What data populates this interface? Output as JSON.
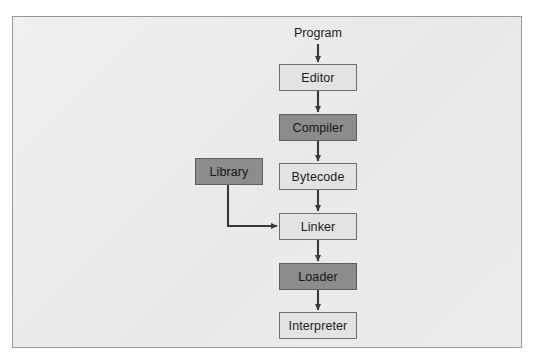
{
  "diagram": {
    "canvas": {
      "width": 535,
      "height": 360
    },
    "frame": {
      "x": 12,
      "y": 16,
      "width": 510,
      "height": 332,
      "fill": "#ececec",
      "border": "#9a9a9a"
    },
    "palette": {
      "light_box_fill": "#e3e3e3",
      "dark_box_fill": "#8c8c8c",
      "box_border": "#6f6f6f",
      "arrow_color": "#3a3a3a",
      "text_color": "#1c1c1c",
      "page_background": "#ffffff"
    },
    "captions": [
      {
        "id": "program",
        "label": "Program",
        "x": 318,
        "y": 33
      }
    ],
    "nodes": [
      {
        "id": "editor",
        "label": "Editor",
        "style": "light",
        "x": 279,
        "y": 64,
        "width": 78,
        "height": 27
      },
      {
        "id": "compiler",
        "label": "Compiler",
        "style": "dark",
        "x": 279,
        "y": 114,
        "width": 78,
        "height": 27
      },
      {
        "id": "library",
        "label": "Library",
        "style": "dark",
        "x": 195,
        "y": 158,
        "width": 68,
        "height": 27
      },
      {
        "id": "bytecode",
        "label": "Bytecode",
        "style": "light",
        "x": 279,
        "y": 163,
        "width": 78,
        "height": 27
      },
      {
        "id": "linker",
        "label": "Linker",
        "style": "light",
        "x": 279,
        "y": 213,
        "width": 78,
        "height": 27
      },
      {
        "id": "loader",
        "label": "Loader",
        "style": "dark",
        "x": 279,
        "y": 263,
        "width": 78,
        "height": 27
      },
      {
        "id": "interpreter",
        "label": "Interpreter",
        "style": "light",
        "x": 279,
        "y": 312,
        "width": 78,
        "height": 27
      }
    ],
    "edges": [
      {
        "id": "program-to-editor",
        "from": "program",
        "to": "editor",
        "kind": "straight-down"
      },
      {
        "id": "editor-to-compiler",
        "from": "editor",
        "to": "compiler",
        "kind": "straight-down"
      },
      {
        "id": "compiler-to-bytecode",
        "from": "compiler",
        "to": "bytecode",
        "kind": "straight-down"
      },
      {
        "id": "bytecode-to-linker",
        "from": "bytecode",
        "to": "linker",
        "kind": "straight-down"
      },
      {
        "id": "library-to-linker",
        "from": "library",
        "to": "linker",
        "kind": "elbow-down-right"
      },
      {
        "id": "linker-to-loader",
        "from": "linker",
        "to": "loader",
        "kind": "straight-down"
      },
      {
        "id": "loader-to-interpreter",
        "from": "loader",
        "to": "interpreter",
        "kind": "straight-down"
      }
    ]
  }
}
